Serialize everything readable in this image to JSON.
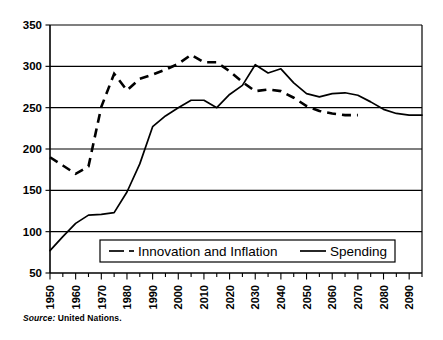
{
  "chart_data": {
    "type": "line",
    "title": "",
    "xlabel": "",
    "ylabel": "",
    "xlim": [
      1950,
      2095
    ],
    "ylim": [
      50,
      350
    ],
    "grid": true,
    "grid_axis": "y",
    "legend_position": "inside-bottom-center",
    "ytick_labels": [
      "350",
      "300",
      "250",
      "200",
      "150",
      "100",
      "50"
    ],
    "ytick_values": [
      350,
      300,
      250,
      200,
      150,
      100,
      50
    ],
    "xtick_labels": [
      "1950",
      "1960",
      "1970",
      "1980",
      "1990",
      "2000",
      "2010",
      "2020",
      "2030",
      "2040",
      "2050",
      "2060",
      "2070",
      "2080",
      "2090"
    ],
    "xtick_values": [
      1950,
      1960,
      1970,
      1980,
      1990,
      2000,
      2010,
      2020,
      2030,
      2040,
      2050,
      2060,
      2070,
      2080,
      2090
    ],
    "xminor_step": 5,
    "series": [
      {
        "name": "Innovation and Inflation",
        "style": "dashed",
        "color": "#000000",
        "x": [
          1950,
          1955,
          1960,
          1965,
          1970,
          1975,
          1980,
          1985,
          1990,
          1995,
          2000,
          2005,
          2010,
          2015,
          2020,
          2025,
          2030,
          2035,
          2040,
          2045,
          2050,
          2055,
          2060,
          2065,
          2070
        ],
        "values": [
          190,
          180,
          170,
          179,
          251,
          291,
          271,
          285,
          290,
          296,
          303,
          314,
          305,
          305,
          294,
          281,
          270,
          272,
          270,
          262,
          252,
          246,
          243,
          241,
          241
        ]
      },
      {
        "name": "Spending",
        "style": "solid",
        "color": "#000000",
        "x": [
          1950,
          1955,
          1960,
          1965,
          1970,
          1975,
          1980,
          1985,
          1990,
          1995,
          2000,
          2005,
          2010,
          2015,
          2020,
          2025,
          2030,
          2035,
          2040,
          2045,
          2050,
          2055,
          2060,
          2065,
          2070,
          2075,
          2080,
          2085,
          2090,
          2095
        ],
        "values": [
          77,
          94,
          110,
          120,
          121,
          123,
          148,
          182,
          227,
          240,
          250,
          259,
          259,
          250,
          266,
          277,
          302,
          292,
          297,
          280,
          267,
          263,
          267,
          268,
          265,
          257,
          248,
          243,
          241,
          241
        ]
      }
    ],
    "legend_entries": [
      {
        "label": "Innovation and Inflation",
        "style": "dashed"
      },
      {
        "label": "Spending",
        "style": "solid"
      }
    ],
    "source_prefix": "Source:",
    "source_text": " United Nations."
  }
}
